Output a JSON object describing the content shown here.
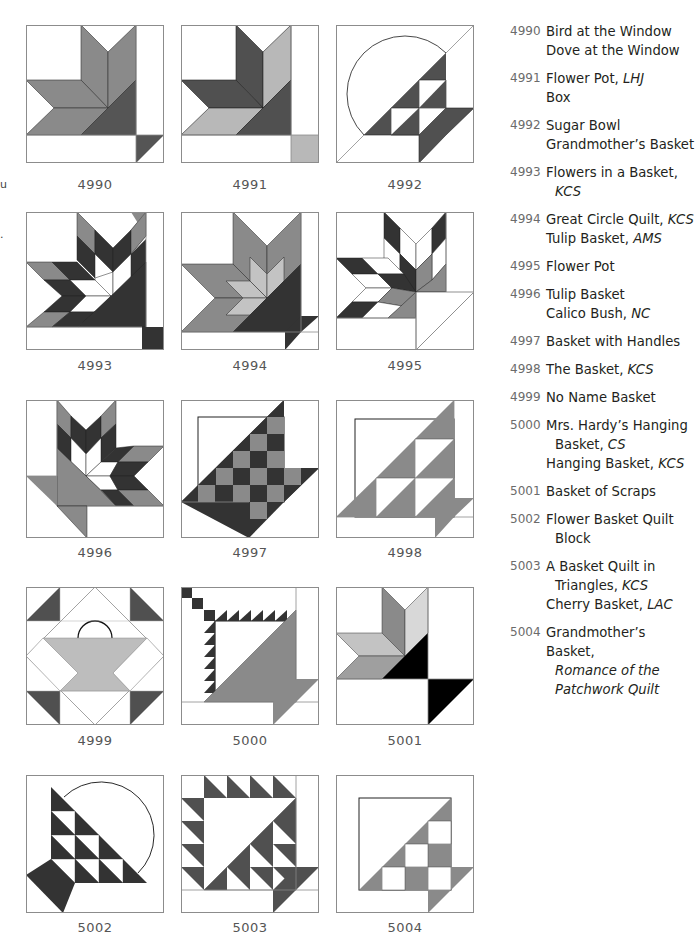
{
  "colors": {
    "light": "#bdbdbd",
    "medium": "#8a8a8a",
    "dark": "#505050",
    "black": "#111111",
    "outline": "#8c8c8c"
  },
  "blocks": [
    {
      "id": "4990"
    },
    {
      "id": "4991"
    },
    {
      "id": "4992"
    },
    {
      "id": "4993"
    },
    {
      "id": "4994"
    },
    {
      "id": "4995"
    },
    {
      "id": "4996"
    },
    {
      "id": "4997"
    },
    {
      "id": "4998"
    },
    {
      "id": "4999"
    },
    {
      "id": "5000"
    },
    {
      "id": "5001"
    },
    {
      "id": "5002"
    },
    {
      "id": "5003"
    },
    {
      "id": "5004"
    }
  ],
  "index": [
    {
      "num": "4990",
      "names": [
        {
          "name": "Bird at the Window",
          "source": "",
          "cont": ""
        },
        {
          "name": "Dove at the Window",
          "source": "",
          "cont": ""
        }
      ]
    },
    {
      "num": "4991",
      "names": [
        {
          "name": "Flower Pot,",
          "source": "LHJ",
          "cont": ""
        },
        {
          "name": "Box",
          "source": "",
          "cont": ""
        }
      ]
    },
    {
      "num": "4992",
      "names": [
        {
          "name": "Sugar Bowl",
          "source": "",
          "cont": ""
        },
        {
          "name": "Grandmother’s Basket",
          "source": "",
          "cont": ""
        }
      ]
    },
    {
      "num": "4993",
      "names": [
        {
          "name": "Flowers in a Basket,",
          "source": "",
          "cont": "KCS"
        }
      ]
    },
    {
      "num": "4994",
      "names": [
        {
          "name": "Great Circle Quilt,",
          "source": "KCS",
          "cont": ""
        },
        {
          "name": "Tulip Basket,",
          "source": "AMS",
          "cont": ""
        }
      ]
    },
    {
      "num": "4995",
      "names": [
        {
          "name": "Flower Pot",
          "source": "",
          "cont": ""
        }
      ]
    },
    {
      "num": "4996",
      "names": [
        {
          "name": "Tulip Basket",
          "source": "",
          "cont": ""
        },
        {
          "name": "Calico Bush,",
          "source": "NC",
          "cont": ""
        }
      ]
    },
    {
      "num": "4997",
      "names": [
        {
          "name": "Basket with Handles",
          "source": "",
          "cont": ""
        }
      ]
    },
    {
      "num": "4998",
      "names": [
        {
          "name": "The Basket,",
          "source": "KCS",
          "cont": ""
        }
      ]
    },
    {
      "num": "4999",
      "names": [
        {
          "name": "No Name Basket",
          "source": "",
          "cont": ""
        }
      ]
    },
    {
      "num": "5000",
      "names": [
        {
          "name": "Mrs. Hardy’s Hanging",
          "source": "",
          "cont": "Basket,",
          "cont_source": "CS"
        },
        {
          "name": "Hanging Basket,",
          "source": "KCS",
          "cont": ""
        }
      ]
    },
    {
      "num": "5001",
      "names": [
        {
          "name": "Basket of Scraps",
          "source": "",
          "cont": ""
        }
      ]
    },
    {
      "num": "5002",
      "names": [
        {
          "name": "Flower Basket Quilt",
          "source": "",
          "cont": "Block"
        }
      ]
    },
    {
      "num": "5003",
      "names": [
        {
          "name": "A Basket Quilt in",
          "source": "",
          "cont": "Triangles,",
          "cont_source": "KCS"
        },
        {
          "name": "Cherry Basket,",
          "source": "LAC",
          "cont": ""
        }
      ]
    },
    {
      "num": "5004",
      "names": [
        {
          "name": "Grandmother’s Basket,",
          "source": "",
          "cont": "",
          "cont_italic": "Romance of the",
          "cont_italic2": "Patchwork Quilt"
        }
      ]
    }
  ],
  "margin_fragments": [
    "u",
    "."
  ]
}
